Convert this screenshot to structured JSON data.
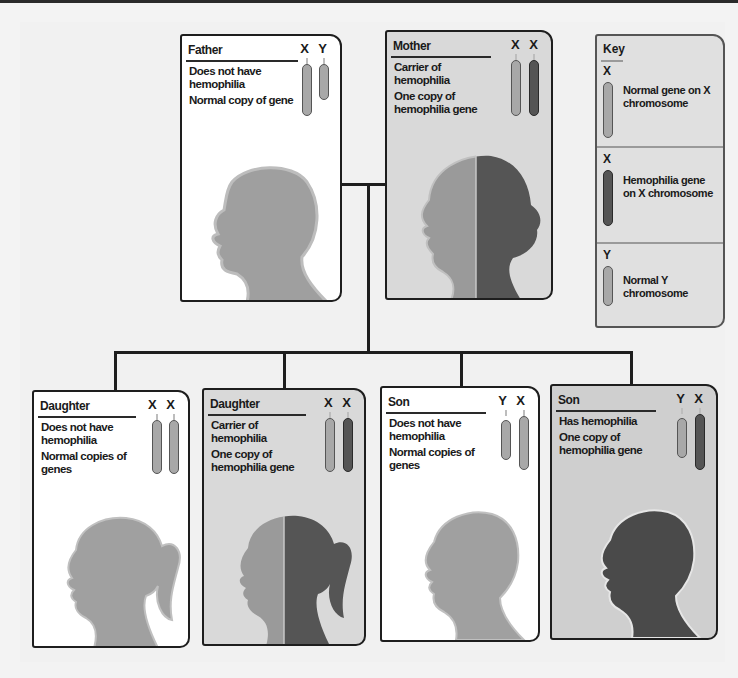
{
  "diagram": {
    "type": "pedigree"
  },
  "parents": [
    {
      "id": "father",
      "title": "Father",
      "chromosomes": [
        "X",
        "Y"
      ],
      "chromosome_types": [
        "normal-x",
        "y"
      ],
      "status": "Does not have hemophilia",
      "gene_note": "Normal copy of gene",
      "silhouette": "adult-male",
      "fill": "normal"
    },
    {
      "id": "mother",
      "title": "Mother",
      "chromosomes": [
        "X",
        "X"
      ],
      "chromosome_types": [
        "normal-x",
        "hemophilia-x"
      ],
      "status": "Carrier of hemophilia",
      "gene_note": "One copy of hemophilia gene",
      "silhouette": "adult-female",
      "fill": "half-carrier"
    }
  ],
  "children": [
    {
      "id": "daughter-1",
      "title": "Daughter",
      "chromosomes": [
        "X",
        "X"
      ],
      "chromosome_types": [
        "normal-x",
        "normal-x"
      ],
      "status": "Does not have hemophilia",
      "gene_note": "Normal copies of genes",
      "silhouette": "girl",
      "fill": "normal"
    },
    {
      "id": "daughter-2",
      "title": "Daughter",
      "chromosomes": [
        "X",
        "X"
      ],
      "chromosome_types": [
        "normal-x",
        "hemophilia-x"
      ],
      "status": "Carrier of hemophilia",
      "gene_note": "One copy of hemophilia gene",
      "silhouette": "girl",
      "fill": "half-carrier"
    },
    {
      "id": "son-1",
      "title": "Son",
      "chromosomes": [
        "Y",
        "X"
      ],
      "chromosome_types": [
        "y",
        "normal-x"
      ],
      "status": "Does not have hemophilia",
      "gene_note": "Normal copies of genes",
      "silhouette": "boy",
      "fill": "normal"
    },
    {
      "id": "son-2",
      "title": "Son",
      "chromosomes": [
        "Y",
        "X"
      ],
      "chromosome_types": [
        "y",
        "hemophilia-x"
      ],
      "status": "Has hemophilia",
      "gene_note": "One copy of hemophilia gene",
      "silhouette": "boy",
      "fill": "affected"
    }
  ],
  "key": {
    "title": "Key",
    "items": [
      {
        "label": "X",
        "icon": "normal-x-chromosome-icon",
        "text": "Normal gene on X chromosome"
      },
      {
        "label": "X",
        "icon": "hemophilia-x-chromosome-icon",
        "text": "Hemophilia gene on X chromosome"
      },
      {
        "label": "Y",
        "icon": "y-chromosome-icon",
        "text": "Normal Y chromosome"
      }
    ]
  },
  "colors": {
    "normal_fill": "#a0a0a0",
    "affected_fill": "#4a4a4a",
    "carrier_card_bg": "#d9d9d9",
    "normal_card_bg": "#ffffff",
    "line": "#1e1e1e"
  }
}
